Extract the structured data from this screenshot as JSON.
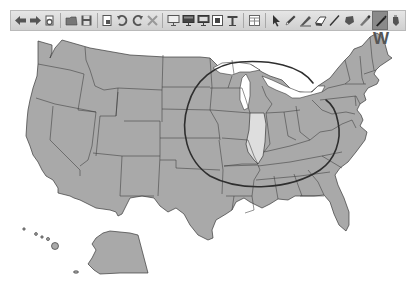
{
  "toolbar": {
    "groups": [
      [
        {
          "name": "back-button",
          "icon": "arrow-left-icon",
          "tooltip": "Back"
        },
        {
          "name": "forward-button",
          "icon": "arrow-right-icon",
          "tooltip": "Forward"
        },
        {
          "name": "refresh-button",
          "icon": "refresh-icon",
          "tooltip": "Refresh"
        }
      ],
      [
        {
          "name": "open-button",
          "icon": "folder-icon",
          "tooltip": "Open"
        },
        {
          "name": "save-button",
          "icon": "floppy-disk-icon",
          "tooltip": "Save"
        }
      ],
      [
        {
          "name": "new-page-button",
          "icon": "page-icon",
          "tooltip": "New Page"
        },
        {
          "name": "undo-button",
          "icon": "undo-icon",
          "tooltip": "Undo"
        },
        {
          "name": "redo-button",
          "icon": "redo-icon",
          "tooltip": "Redo"
        },
        {
          "name": "delete-button",
          "icon": "x-icon",
          "tooltip": "Delete"
        }
      ],
      [
        {
          "name": "screen-shade-button",
          "icon": "monitor-icon",
          "tooltip": "Screen"
        },
        {
          "name": "display-button",
          "icon": "monitor-filled-icon",
          "tooltip": "Display"
        },
        {
          "name": "presentation-button",
          "icon": "monitor-stand-icon",
          "tooltip": "Presentation"
        },
        {
          "name": "insert-image-button",
          "icon": "image-frame-icon",
          "tooltip": "Insert"
        },
        {
          "name": "text-tool-button",
          "icon": "text-t-icon",
          "tooltip": "Text"
        }
      ],
      [
        {
          "name": "table-button",
          "icon": "table-icon",
          "tooltip": "Table"
        }
      ],
      [
        {
          "name": "select-tool-button",
          "icon": "pointer-icon",
          "tooltip": "Select"
        },
        {
          "name": "pen-tool-button",
          "icon": "pen-icon",
          "tooltip": "Pen"
        },
        {
          "name": "creative-pen-button",
          "icon": "calligraphy-pen-icon",
          "tooltip": "Creative Pen"
        },
        {
          "name": "eraser-button",
          "icon": "eraser-icon",
          "tooltip": "Eraser"
        },
        {
          "name": "line-tool-button",
          "icon": "line-icon",
          "tooltip": "Line"
        },
        {
          "name": "shape-tool-button",
          "icon": "shape-icon",
          "tooltip": "Shape"
        },
        {
          "name": "highlighter-button",
          "icon": "highlighter-icon",
          "tooltip": "Highlighter"
        },
        {
          "name": "marker-button",
          "icon": "marker-icon",
          "tooltip": "Marker",
          "active": true
        },
        {
          "name": "fill-button",
          "icon": "paint-bucket-icon",
          "tooltip": "Fill"
        }
      ]
    ]
  },
  "cursor": {
    "label": "W"
  },
  "map": {
    "title": "United States map",
    "highlighted_state": "Illinois",
    "state_fill": "#a9a9a9",
    "highlight_fill": "#dedede",
    "border_color": "#3a3a3a",
    "annotation": {
      "type": "freehand-circle",
      "color": "#333333",
      "around": "Midwest"
    }
  },
  "colors": {
    "toolbar_bg": "#d8d8d8",
    "active_tool_bg": "#8a8a8a",
    "map_fill": "#a9a9a9"
  }
}
